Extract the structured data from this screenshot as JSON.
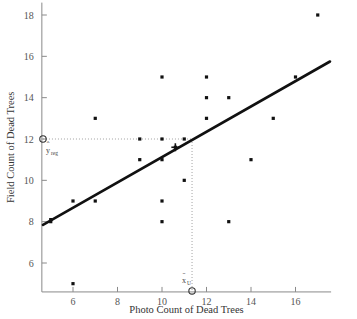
{
  "chart_data": {
    "type": "scatter",
    "title": "",
    "xlabel": "Photo Count of Dead Trees",
    "ylabel": "Field Count of Dead Trees",
    "xlim": [
      4.6,
      17.6
    ],
    "ylim": [
      4.6,
      18.6
    ],
    "xticks": [
      6,
      8,
      10,
      12,
      14,
      16
    ],
    "yticks": [
      6,
      8,
      10,
      12,
      14,
      16,
      18
    ],
    "xtick_labels": [
      "6",
      "8",
      "10",
      "12",
      "14",
      "16"
    ],
    "ytick_labels": [
      "6",
      "8",
      "10",
      "12",
      "14",
      "16",
      "18"
    ],
    "grid": false,
    "legend": false,
    "points": [
      {
        "x": 5,
        "y": 8
      },
      {
        "x": 5,
        "y": 8.1
      },
      {
        "x": 6,
        "y": 9
      },
      {
        "x": 6,
        "y": 5
      },
      {
        "x": 7,
        "y": 9
      },
      {
        "x": 7,
        "y": 13
      },
      {
        "x": 9,
        "y": 12
      },
      {
        "x": 9,
        "y": 11
      },
      {
        "x": 10,
        "y": 15
      },
      {
        "x": 10,
        "y": 12
      },
      {
        "x": 10,
        "y": 11
      },
      {
        "x": 10,
        "y": 9
      },
      {
        "x": 10,
        "y": 8
      },
      {
        "x": 10.6,
        "y": 11.6
      },
      {
        "x": 11,
        "y": 12
      },
      {
        "x": 11,
        "y": 10
      },
      {
        "x": 12,
        "y": 15
      },
      {
        "x": 12,
        "y": 14
      },
      {
        "x": 12,
        "y": 13
      },
      {
        "x": 13,
        "y": 14
      },
      {
        "x": 13,
        "y": 8
      },
      {
        "x": 14,
        "y": 11
      },
      {
        "x": 15,
        "y": 13
      },
      {
        "x": 16,
        "y": 15
      },
      {
        "x": 17,
        "y": 18
      }
    ],
    "regression_line": {
      "x_start": 4.65,
      "y_start": 7.85,
      "x_end": 17.55,
      "y_end": 15.75,
      "label": "regression-fit-line"
    },
    "centroid_marker": {
      "x": 10.6,
      "y": 11.6,
      "symbol": "cross"
    },
    "annotations": [
      {
        "name": "y-hat-reg",
        "label": "y",
        "hat": "ˆ",
        "subscript": "reg",
        "value_x": 4.65,
        "value_y": 12,
        "marker": "open-circle"
      },
      {
        "name": "x-bar-sub",
        "label": "x",
        "bar": "̄",
        "subscript": "U",
        "value_x": 11.35,
        "value_y": 4.65,
        "marker": "open-circle"
      }
    ],
    "guide_lines": [
      {
        "name": "horizontal-guide-to-yhat",
        "from": [
          4.65,
          12
        ],
        "to": [
          11.35,
          12
        ]
      },
      {
        "name": "vertical-guide-to-xbar",
        "from": [
          11.35,
          12
        ],
        "to": [
          11.35,
          4.65
        ]
      }
    ]
  },
  "axes": {
    "x_title": "Photo Count of Dead Trees",
    "y_title": "Field Count of Dead Trees"
  },
  "annotation_text": {
    "y_hat": "y",
    "y_hat_accent": "ˆ",
    "y_hat_sub": "reg",
    "x_bar": "x",
    "x_bar_accent": "̄",
    "x_bar_sub": "U"
  }
}
